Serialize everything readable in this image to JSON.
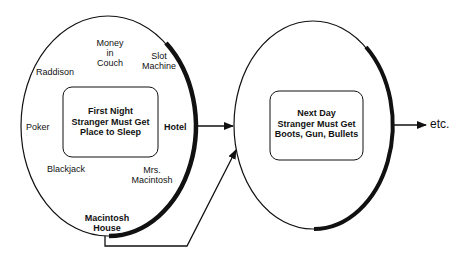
{
  "diagram": {
    "stage1": {
      "box_lines": [
        "First Night",
        "Stranger Must Get",
        "Place to Sleep"
      ],
      "options": {
        "money_in_couch": [
          "Money",
          "in",
          "Couch"
        ],
        "slot_machine": [
          "Slot",
          "Machine"
        ],
        "raddison": "Raddison",
        "poker": "Poker",
        "hotel": "Hotel",
        "blackjack": "Blackjack",
        "mrs_macintosh": [
          "Mrs.",
          "Macintosh"
        ],
        "macintosh_house": [
          "Macintosh",
          "House"
        ]
      }
    },
    "stage2": {
      "box_lines": [
        "Next Day",
        "Stranger Must Get",
        "Boots, Gun, Bullets"
      ]
    },
    "continuation": "etc.",
    "colors": {
      "stroke": "#111111",
      "background": "#ffffff"
    }
  }
}
